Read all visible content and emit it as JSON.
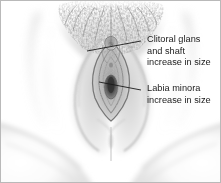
{
  "figure": {
    "type": "anatomical-illustration",
    "style": "grayscale pencil / stipple medical drawing",
    "border_color": "#b9b9b9",
    "background_color": "#ffffff",
    "ink_color": "#1a1a1a"
  },
  "annotations": [
    {
      "id": "clitoris",
      "lines": [
        "Clitoral glans",
        "and shaft",
        "increase in size"
      ],
      "text_x": 146,
      "text_y": 33,
      "leader": {
        "x1": 140,
        "y1": 40,
        "x2": 86,
        "y2": 50
      },
      "target": "clitoral-glans"
    },
    {
      "id": "labia",
      "lines": [
        "Labia minora",
        "increase in size"
      ],
      "text_x": 146,
      "text_y": 82,
      "leader": {
        "x1": 140,
        "y1": 89,
        "x2": 98,
        "y2": 81
      },
      "target": "labia-minora"
    }
  ],
  "anatomy": {
    "mons_pubis": "stippled pubic hair triangle across upper center",
    "labia_majora": "large soft shaded outer folds framing the midline",
    "labia_minora": "inner folds outlined around the vestibule",
    "clitoral_glans": "small rounded form at the top of the vestibule",
    "vaginal_opening": "dark ovoid at the lower vestibule",
    "perineum": "vertical midline raphe below the vestibule",
    "thighs": "soft curved contours at lower left and lower right"
  }
}
